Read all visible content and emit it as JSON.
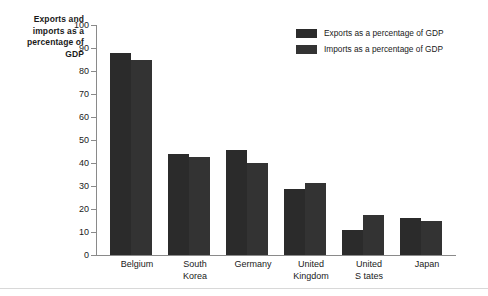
{
  "chart_data": {
    "type": "bar",
    "title": "",
    "ylabel": "Exports and imports as a percentage of GDP",
    "xlabel": "",
    "ylim": [
      0,
      100
    ],
    "yticks": [
      0,
      10,
      20,
      30,
      40,
      50,
      60,
      70,
      80,
      90,
      100
    ],
    "grid": false,
    "legend_position": "top-right",
    "categories": [
      "Belgium",
      "South Korea",
      "Germany",
      "United Kingdom",
      "United States",
      "Japan"
    ],
    "series": [
      {
        "name": "Exports as a percentage of GDP",
        "color": "#2b2b2b",
        "values": [
          88,
          44,
          45.5,
          28.5,
          11,
          16
        ]
      },
      {
        "name": "Imports as a percentage of GDP",
        "color": "#333333",
        "values": [
          85,
          42.5,
          40,
          31.5,
          17.5,
          15
        ]
      }
    ]
  },
  "axis": {
    "y_title": "Exports and imports as a percentage of GDP",
    "tick_labels": [
      "100",
      "90",
      "80",
      "70",
      "60",
      "50",
      "40",
      "30",
      "20",
      "10",
      "0"
    ],
    "category_labels": [
      [
        "Belgium"
      ],
      [
        "South",
        "Korea"
      ],
      [
        "Germany"
      ],
      [
        "United",
        "Kingdom"
      ],
      [
        "United",
        "S tates"
      ],
      [
        "Japan"
      ]
    ]
  },
  "legend": {
    "items": [
      {
        "label": "Exports as a percentage of GDP",
        "color": "#2b2b2b"
      },
      {
        "label": "Imports as a percentage of GDP",
        "color": "#333333"
      }
    ]
  }
}
